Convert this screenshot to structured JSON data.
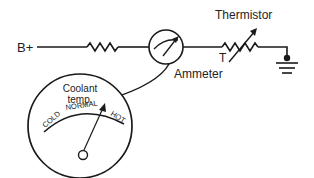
{
  "diagram": {
    "labels": {
      "supply": "B+",
      "thermistor": "Thermistor",
      "thermistor_symbol": "T",
      "ammeter": "Ammeter"
    },
    "gauge": {
      "title_line1": "Coolant",
      "title_line2": "temp.",
      "scale": {
        "cold": "COLD",
        "normal": "NORMAL",
        "hot": "HOT"
      }
    },
    "colors": {
      "line": "#1a1a1a",
      "background": "#ffffff"
    }
  }
}
